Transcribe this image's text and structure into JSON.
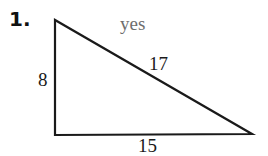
{
  "problem": {
    "number": "1.",
    "answer": "yes"
  },
  "triangle": {
    "sides": {
      "left_leg": "8",
      "hypotenuse": "17",
      "bottom_leg": "15"
    },
    "vertices": {
      "top_left": [
        55,
        20
      ],
      "bottom_left": [
        55,
        135
      ],
      "bottom_right": [
        252,
        134
      ]
    },
    "stroke_color": "#1a1a1a"
  },
  "colors": {
    "text": "#1a1a1a",
    "answer_text": "#6e6e6e",
    "background": "#ffffff"
  }
}
